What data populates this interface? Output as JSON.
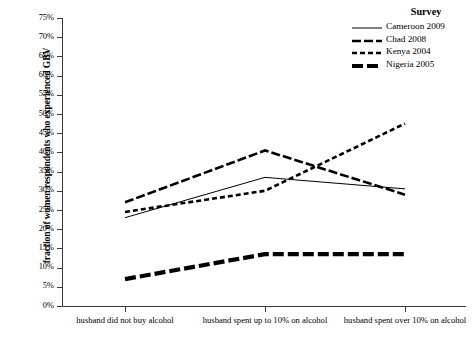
{
  "chart_data": {
    "type": "line",
    "title": "",
    "xlabel": "",
    "ylabel": "fraction of women respondents who experienced GBV",
    "categories": [
      "husband did not buy alcohol",
      "husband spent up to 10% on alcohol",
      "husband spent over 10% on alcohol"
    ],
    "ylim": [
      0,
      75
    ],
    "ytick_labels": [
      "0%",
      "5%",
      "10%",
      "15%",
      "20%",
      "25%",
      "30%",
      "35%",
      "40%",
      "45%",
      "50%",
      "55%",
      "60%",
      "65%",
      "70%",
      "75%"
    ],
    "ytick_values": [
      0,
      5,
      10,
      15,
      20,
      25,
      30,
      35,
      40,
      45,
      50,
      55,
      60,
      65,
      70,
      75
    ],
    "grid": false,
    "legend_position": "top-right",
    "legend_title": "Survey",
    "series": [
      {
        "name": "Cameroon 2009",
        "values": [
          23.0,
          33.5,
          30.5
        ],
        "style": "thin-solid",
        "color": "#000000",
        "width": 1.0,
        "dash": ""
      },
      {
        "name": "Chad 2008",
        "values": [
          27.0,
          40.5,
          29.0
        ],
        "style": "thick-dashed",
        "color": "#000000",
        "width": 2.6,
        "dash": "9,3"
      },
      {
        "name": "Kenya 2004",
        "values": [
          24.5,
          30.0,
          47.5
        ],
        "style": "dotted-dashed",
        "color": "#000000",
        "width": 2.6,
        "dash": "5,3"
      },
      {
        "name": "Nigeria 2005",
        "values": [
          7.0,
          13.5,
          13.5
        ],
        "style": "thick-dash-dot",
        "color": "#000000",
        "width": 4.2,
        "dash": "11,4"
      }
    ]
  },
  "axes": {
    "y_title": "fraction of women respondents who experienced GBV"
  }
}
